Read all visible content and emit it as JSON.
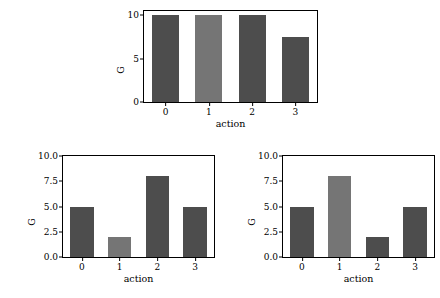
{
  "figure": {
    "background_color": "#ffffff",
    "bar_color_default": "#4d4d4d",
    "bar_color_highlight": "#757575",
    "axis_color": "#000000"
  },
  "chart_data": [
    {
      "id": "top",
      "type": "bar",
      "title": "",
      "xlabel": "action",
      "ylabel": "G",
      "categories": [
        "0",
        "1",
        "2",
        "3"
      ],
      "values": [
        10.0,
        10.0,
        10.0,
        7.5
      ],
      "highlight_index": 1,
      "ylim": [
        0,
        10.5
      ],
      "yticks": [
        "0",
        "5",
        "10"
      ],
      "ytick_values": [
        0,
        5,
        10
      ],
      "xticks": [
        "0",
        "1",
        "2",
        "3"
      ],
      "grid": false,
      "legend": "none"
    },
    {
      "id": "bottom-left",
      "type": "bar",
      "title": "",
      "xlabel": "action",
      "ylabel": "G",
      "categories": [
        "0",
        "1",
        "2",
        "3"
      ],
      "values": [
        5.0,
        2.0,
        8.0,
        5.0
      ],
      "highlight_index": 1,
      "ylim": [
        0,
        10.0
      ],
      "yticks": [
        "0.0",
        "2.5",
        "5.0",
        "7.5",
        "10.0"
      ],
      "ytick_values": [
        0,
        2.5,
        5,
        7.5,
        10
      ],
      "xticks": [
        "0",
        "1",
        "2",
        "3"
      ],
      "grid": false,
      "legend": "none"
    },
    {
      "id": "bottom-right",
      "type": "bar",
      "title": "",
      "xlabel": "action",
      "ylabel": "G",
      "categories": [
        "0",
        "1",
        "2",
        "3"
      ],
      "values": [
        5.0,
        8.0,
        2.0,
        5.0
      ],
      "highlight_index": 1,
      "ylim": [
        0,
        10.0
      ],
      "yticks": [
        "0.0",
        "2.5",
        "5.0",
        "7.5",
        "10.0"
      ],
      "ytick_values": [
        0,
        2.5,
        5,
        7.5,
        10
      ],
      "xticks": [
        "0",
        "1",
        "2",
        "3"
      ],
      "grid": false,
      "legend": "none"
    }
  ]
}
